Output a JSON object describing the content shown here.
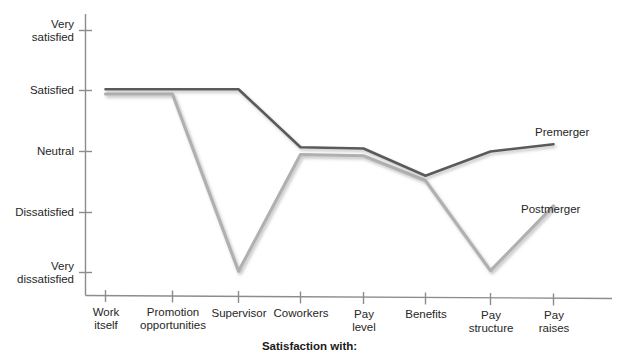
{
  "chart_data": {
    "type": "line",
    "title": "",
    "xlabel": "Satisfaction with:",
    "ylabel": "",
    "grid": false,
    "legend_position": "inline-right",
    "categories": [
      "Work\nitself",
      "Promotion\nopportunities",
      "Supervisor",
      "Coworkers",
      "Pay\nlevel",
      "Benefits",
      "Pay\nstructure",
      "Pay\nraises"
    ],
    "ytick_labels": [
      "Very\nsatisfied",
      "Satisfied",
      "Neutral",
      "Dissatisfied",
      "Very\ndissatisfied"
    ],
    "yticks": [
      5,
      4,
      3,
      2,
      1
    ],
    "ylim": [
      1,
      5
    ],
    "series": [
      {
        "name": "Premerger",
        "color": "#5a5a5a",
        "values": [
          4.03,
          4.03,
          4.03,
          3.07,
          3.05,
          2.6,
          3.0,
          3.12
        ]
      },
      {
        "name": "Postmerger",
        "color": "#b0b0b0",
        "values": [
          3.95,
          3.95,
          1.02,
          2.95,
          2.93,
          2.52,
          1.03,
          2.1
        ]
      }
    ]
  },
  "axis": {
    "line_color": "#8c8c8c"
  },
  "labels": {
    "premerger": "Premerger",
    "postmerger": "Postmerger",
    "xaxis_title": "Satisfaction with:"
  }
}
